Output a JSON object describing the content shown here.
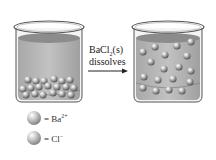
{
  "diagram": {
    "arrow_label": {
      "line1_prefix": "BaCl",
      "line1_sub": "2",
      "line1_suffix": "(s)",
      "line2": "dissolves"
    },
    "beakers": [
      {
        "id": "before",
        "label": "solid BaCl2 at bottom of beaker",
        "state": "undissolved"
      },
      {
        "id": "after",
        "label": "ions dispersed in solution",
        "state": "dissolved"
      }
    ],
    "legend": [
      {
        "symbol": "= Ba",
        "sup": "2+",
        "ion": "Ba2+"
      },
      {
        "symbol": "= Cl",
        "sup": "−",
        "ion": "Cl-"
      }
    ],
    "colors": {
      "liquid": "#b4b4b4",
      "liquid_top": "#8c8c8c",
      "glass_outline": "#555555",
      "ball_highlight": "#ffffff",
      "ball_shadow": "#5a5a5a"
    }
  }
}
